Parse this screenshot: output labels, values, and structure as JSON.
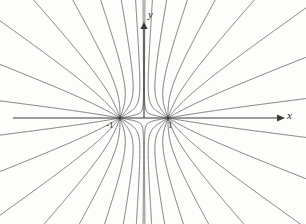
{
  "figure": {
    "background_color": "#fdfdfc",
    "line_color": "#5a5a5a",
    "axis_color": "#3a3a3a",
    "width": 306,
    "height": 224
  },
  "axes": {
    "x_axis": {
      "label": "x",
      "name": "x-axis",
      "arrow": "right",
      "y_pixel": 118,
      "start_x": 13,
      "end_x": 278
    },
    "y_axis": {
      "label": "y",
      "name": "y-axis",
      "arrow": "up",
      "x_pixel": 144,
      "start_y": 118,
      "end_y": 22
    }
  },
  "ticks": [
    {
      "label": "-1",
      "value": -1,
      "axis": "x",
      "x_pixel": 120
    },
    {
      "label": "1",
      "value": 1,
      "axis": "x",
      "x_pixel": 168
    }
  ],
  "chart_data": {
    "type": "line",
    "xlabel": "x",
    "ylabel": "y",
    "grid": false,
    "legend": null,
    "xlim": [
      -6,
      6
    ],
    "ylim": [
      -4.5,
      4.5
    ],
    "foci": [
      {
        "name": "left-focus",
        "x": -1,
        "y": 0,
        "x_pixel": 120,
        "y_pixel": 118
      },
      {
        "name": "right-focus",
        "x": 1,
        "y": 0,
        "x_pixel": 168,
        "y_pixel": 118
      }
    ],
    "n_curves_per_focus": 18,
    "curve_family": "radial-field-lines"
  }
}
